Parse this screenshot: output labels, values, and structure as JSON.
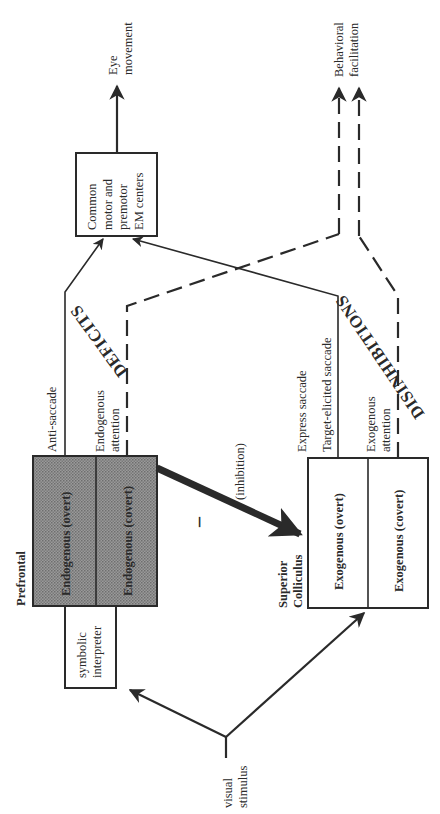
{
  "diagram": {
    "nodes": {
      "common_motor": {
        "lines": [
          "Common",
          "motor and",
          "premotor",
          "EM centers"
        ]
      },
      "prefrontal": {
        "title": "Prefrontal",
        "cells": [
          "Endogenous (overt)",
          "Endogenous (covert)"
        ]
      },
      "symbolic": {
        "lines": [
          "symbolic",
          "interpreter"
        ]
      },
      "superior_colliculus": {
        "title_lines": [
          "Superior",
          "Colliculus"
        ],
        "cells": [
          "Exogenous (overt)",
          "Exogenous (covert)"
        ]
      },
      "visual_stimulus": {
        "lines": [
          "visual",
          "stimulus"
        ]
      }
    },
    "outputs": {
      "eye_movement": [
        "Eye",
        "movement"
      ],
      "behavioral": [
        "Behavioral",
        "facilitation"
      ]
    },
    "edge_labels": {
      "anti_saccade": "Anti-saccade",
      "endogenous_attention": [
        "Endogenous",
        "attention"
      ],
      "express_saccade": "Express saccade",
      "target_elicited": "Target-elicited saccade",
      "exogenous_attention": [
        "Exogenous",
        "attention"
      ],
      "inhibition": "(inhibition)",
      "minus": "–"
    },
    "annotations": {
      "deficits": "DEFICITS",
      "disinhibitions": "DISINHIBITIONS"
    },
    "colors": {
      "ink": "#2a2a2a",
      "shade": "#8c8c8c"
    }
  }
}
